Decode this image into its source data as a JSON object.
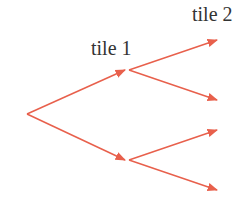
{
  "diagram": {
    "type": "tree",
    "labels": {
      "level1": "tile 1",
      "level2": "tile 2"
    },
    "arrow_color": "#e8604c",
    "text_color": "#333333",
    "edges": [
      {
        "from": [
          27,
          114
        ],
        "to": [
          125,
          70
        ]
      },
      {
        "from": [
          27,
          114
        ],
        "to": [
          125,
          160
        ]
      },
      {
        "from": [
          129,
          70
        ],
        "to": [
          217,
          40
        ]
      },
      {
        "from": [
          129,
          70
        ],
        "to": [
          217,
          100
        ]
      },
      {
        "from": [
          129,
          160
        ],
        "to": [
          217,
          130
        ]
      },
      {
        "from": [
          129,
          160
        ],
        "to": [
          217,
          190
        ]
      }
    ]
  }
}
